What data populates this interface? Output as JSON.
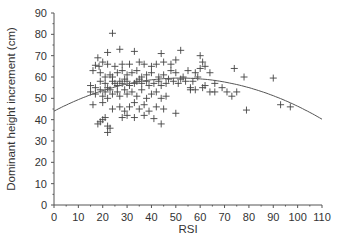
{
  "chart_data": {
    "type": "scatter",
    "title": "",
    "xlabel": "RSI",
    "ylabel": "Dominant height increment (cm)",
    "xlim": [
      0,
      110
    ],
    "ylim": [
      0,
      90
    ],
    "xticks": [
      0,
      10,
      20,
      30,
      40,
      50,
      60,
      70,
      80,
      90,
      100,
      110
    ],
    "yticks": [
      0,
      10,
      20,
      30,
      40,
      50,
      60,
      70,
      80,
      90
    ],
    "grid": false,
    "legend": null,
    "marker": "+",
    "trend_line": {
      "type": "quadratic",
      "coefficients": {
        "a": 44,
        "b": 0.596,
        "c": -0.00573
      },
      "x_range": [
        0,
        110
      ]
    },
    "series": [
      {
        "name": "observations",
        "points": [
          [
            24,
            80.5
          ],
          [
            27,
            73
          ],
          [
            33,
            72
          ],
          [
            44,
            71
          ],
          [
            22,
            71.5
          ],
          [
            18,
            69
          ],
          [
            52,
            72.5
          ],
          [
            60,
            70
          ],
          [
            20,
            67
          ],
          [
            17,
            65.5
          ],
          [
            18.5,
            65
          ],
          [
            22,
            66
          ],
          [
            25,
            65
          ],
          [
            28,
            66
          ],
          [
            31,
            66
          ],
          [
            35,
            67
          ],
          [
            37,
            66
          ],
          [
            40,
            65
          ],
          [
            42,
            66
          ],
          [
            45,
            67
          ],
          [
            48,
            66
          ],
          [
            50,
            68
          ],
          [
            61,
            67
          ],
          [
            62,
            65
          ],
          [
            16,
            63
          ],
          [
            19,
            62
          ],
          [
            21,
            60
          ],
          [
            23,
            61
          ],
          [
            24,
            60
          ],
          [
            26,
            62
          ],
          [
            28,
            63
          ],
          [
            30,
            61
          ],
          [
            32,
            62
          ],
          [
            34,
            63
          ],
          [
            36,
            60
          ],
          [
            38,
            61
          ],
          [
            40,
            62
          ],
          [
            43,
            60
          ],
          [
            45,
            61
          ],
          [
            48,
            63
          ],
          [
            50,
            62
          ],
          [
            53,
            60
          ],
          [
            55,
            63
          ],
          [
            58,
            62
          ],
          [
            60,
            64
          ],
          [
            59,
            60
          ],
          [
            64,
            62
          ],
          [
            66,
            57
          ],
          [
            74,
            64
          ],
          [
            78,
            60
          ],
          [
            90,
            59.5
          ],
          [
            15,
            56
          ],
          [
            17,
            55
          ],
          [
            19,
            58
          ],
          [
            21,
            57
          ],
          [
            22,
            55
          ],
          [
            24,
            58
          ],
          [
            25,
            57
          ],
          [
            26,
            56
          ],
          [
            27,
            58
          ],
          [
            28,
            57
          ],
          [
            29,
            59
          ],
          [
            30,
            58
          ],
          [
            31,
            56
          ],
          [
            33,
            57
          ],
          [
            34,
            58
          ],
          [
            35,
            59
          ],
          [
            36,
            57
          ],
          [
            38,
            58
          ],
          [
            39,
            56
          ],
          [
            41,
            57
          ],
          [
            43,
            58
          ],
          [
            44,
            56
          ],
          [
            46,
            57
          ],
          [
            47,
            59
          ],
          [
            49,
            58
          ],
          [
            51,
            57
          ],
          [
            52,
            59
          ],
          [
            54,
            58
          ],
          [
            56,
            55
          ],
          [
            57,
            58
          ],
          [
            62,
            56
          ],
          [
            15,
            53
          ],
          [
            17,
            52
          ],
          [
            19,
            54
          ],
          [
            20,
            51
          ],
          [
            21,
            53
          ],
          [
            22,
            50
          ],
          [
            23,
            54
          ],
          [
            24,
            52
          ],
          [
            26,
            53
          ],
          [
            27,
            51
          ],
          [
            29,
            54
          ],
          [
            30,
            52
          ],
          [
            32,
            53
          ],
          [
            34,
            51
          ],
          [
            36,
            54
          ],
          [
            38,
            50
          ],
          [
            40,
            52
          ],
          [
            42,
            53
          ],
          [
            44,
            50
          ],
          [
            46,
            51
          ],
          [
            56,
            54
          ],
          [
            58,
            54
          ],
          [
            61,
            55
          ],
          [
            64,
            53
          ],
          [
            66,
            53
          ],
          [
            69,
            55
          ],
          [
            71,
            53
          ],
          [
            73,
            51
          ],
          [
            75,
            53
          ],
          [
            16,
            47
          ],
          [
            20,
            48
          ],
          [
            24,
            45
          ],
          [
            27,
            46
          ],
          [
            29,
            44
          ],
          [
            31,
            46
          ],
          [
            33,
            48
          ],
          [
            35,
            45
          ],
          [
            37,
            47
          ],
          [
            39,
            44
          ],
          [
            42,
            46
          ],
          [
            45,
            45
          ],
          [
            50,
            43
          ],
          [
            28,
            41
          ],
          [
            30,
            42
          ],
          [
            21,
            41
          ],
          [
            20,
            40
          ],
          [
            19,
            39
          ],
          [
            18,
            38
          ],
          [
            22,
            37
          ],
          [
            23,
            36
          ],
          [
            22,
            34
          ],
          [
            44,
            38
          ],
          [
            41,
            40.5
          ],
          [
            37,
            42
          ],
          [
            33,
            41
          ],
          [
            79,
            44.5
          ],
          [
            93,
            47
          ],
          [
            97,
            46
          ]
        ]
      }
    ]
  }
}
